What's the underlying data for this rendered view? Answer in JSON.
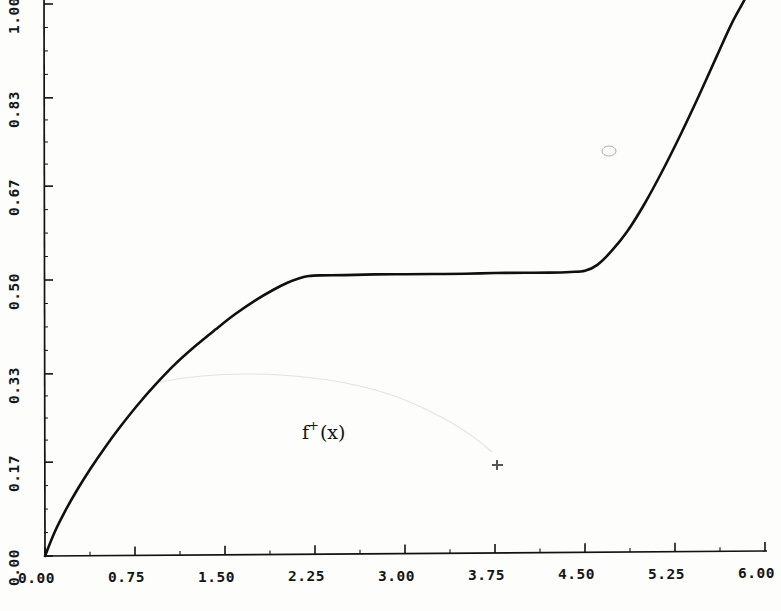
{
  "chart_data": {
    "type": "line",
    "title": "",
    "subtitle": "",
    "xlabel": "",
    "ylabel": "",
    "xlim": [
      0.0,
      6.0
    ],
    "ylim": [
      0.0,
      1.0
    ],
    "grid": false,
    "legend_position": "none",
    "x_ticks": [
      "0.00",
      "0.75",
      "1.50",
      "2.25",
      "3.00",
      "3.75",
      "4.50",
      "5.25",
      "6.00"
    ],
    "x_tick_values": [
      0.0,
      0.75,
      1.5,
      2.25,
      3.0,
      3.75,
      4.5,
      5.25,
      6.0
    ],
    "y_ticks": [
      "0.00",
      "0.17",
      "0.33",
      "0.50",
      "0.67",
      "0.83",
      "1.00"
    ],
    "y_tick_values": [
      0.0,
      0.17,
      0.33,
      0.5,
      0.67,
      0.83,
      1.0
    ],
    "x_minor_ticks_per_interval": 1,
    "y_minor_ticks_per_interval": 3,
    "annotations": [
      {
        "name": "curve-label",
        "text_base": "f",
        "text_superscript": "+",
        "text_argument": "(x)",
        "x": 2.2,
        "y": 0.21
      }
    ],
    "series": [
      {
        "name": "f+(x)",
        "color": "#101010",
        "line_width": 2.6,
        "x": [
          0.0,
          0.08,
          0.17,
          0.27,
          0.38,
          0.5,
          0.63,
          0.77,
          0.92,
          1.08,
          1.25,
          1.42,
          1.58,
          1.75,
          1.9,
          2.02,
          2.12,
          2.2,
          2.3,
          2.5,
          2.75,
          3.0,
          3.25,
          3.5,
          3.75,
          4.0,
          4.2,
          4.38,
          4.5,
          4.6,
          4.72,
          4.85,
          5.0,
          5.15,
          5.3,
          5.45,
          5.6,
          5.72,
          5.82,
          5.88
        ],
        "y": [
          0.0,
          0.043,
          0.082,
          0.12,
          0.158,
          0.196,
          0.234,
          0.272,
          0.309,
          0.345,
          0.378,
          0.408,
          0.435,
          0.46,
          0.479,
          0.492,
          0.5,
          0.504,
          0.505,
          0.505,
          0.506,
          0.506,
          0.506,
          0.506,
          0.507,
          0.507,
          0.507,
          0.508,
          0.51,
          0.52,
          0.545,
          0.58,
          0.632,
          0.692,
          0.757,
          0.826,
          0.898,
          0.955,
          0.995,
          1.02
        ]
      }
    ]
  },
  "axes": {
    "axis_color": "#121212",
    "axis_line_width": 1.6,
    "tick_length_major": 9,
    "tick_length_minor": 4
  },
  "background": {
    "paper_color": "#fdfdfc",
    "ink_color": "#121212"
  }
}
